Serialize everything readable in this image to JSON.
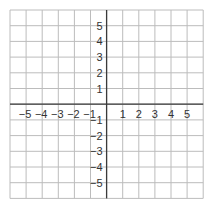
{
  "chart_data": {
    "type": "coordinate-grid",
    "title": "",
    "xlabel": "",
    "ylabel": "",
    "xlim": [
      -6,
      6
    ],
    "ylim": [
      -6,
      6
    ],
    "grid": true,
    "x_ticks": [
      -5,
      -4,
      -3,
      -2,
      -1,
      1,
      2,
      3,
      4,
      5
    ],
    "y_ticks": [
      5,
      4,
      3,
      2,
      1,
      -1,
      -2,
      -3,
      -4,
      -5
    ],
    "x_tick_labels": [
      "−5",
      "−4",
      "−3",
      "−2",
      "−1",
      "1",
      "2",
      "3",
      "4",
      "5"
    ],
    "y_tick_labels": [
      "5",
      "4",
      "3",
      "2",
      "1",
      "−1",
      "−2",
      "−3",
      "−4",
      "−5"
    ],
    "series": []
  },
  "layout": {
    "grid_color": "#bcbcbc",
    "axis_color": "#3a3a3a",
    "label_color": "#333333",
    "origin_px": [
      107,
      104
    ],
    "cell_w": 16.1,
    "cell_h": 15.7,
    "left": 10,
    "top": 10,
    "cols": 12,
    "rows": 12
  }
}
